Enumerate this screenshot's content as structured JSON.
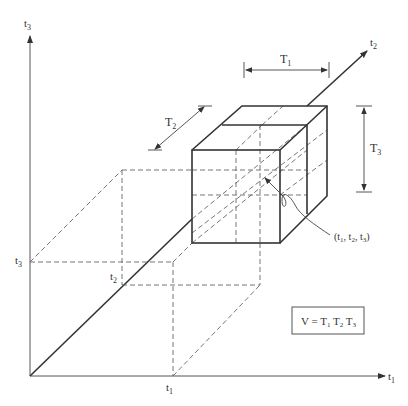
{
  "axes": {
    "t1": {
      "label": "t",
      "sub": "1"
    },
    "t2": {
      "label": "t",
      "sub": "2"
    },
    "t3": {
      "label": "t",
      "sub": "3"
    }
  },
  "ticks": {
    "t1": {
      "label": "t",
      "sub": "1"
    },
    "t2": {
      "label": "t",
      "sub": "2"
    },
    "t3": {
      "label": "t",
      "sub": "3"
    }
  },
  "dimensions": {
    "T1": {
      "label": "T",
      "sub": "1"
    },
    "T2": {
      "label": "T",
      "sub": "2"
    },
    "T3": {
      "label": "T",
      "sub": "3"
    }
  },
  "point_label": {
    "open": "(t",
    "s1": "1",
    "c1": ", t",
    "s2": "2",
    "c2": ", t",
    "s3": "3",
    "close": ")"
  },
  "formula": {
    "lhs": "V = T",
    "s1": "1",
    "m1": " T",
    "s2": "2",
    "m2": " T",
    "s3": "3"
  },
  "colors": {
    "line": "#333333",
    "dashed": "#666666",
    "background": "#ffffff"
  }
}
